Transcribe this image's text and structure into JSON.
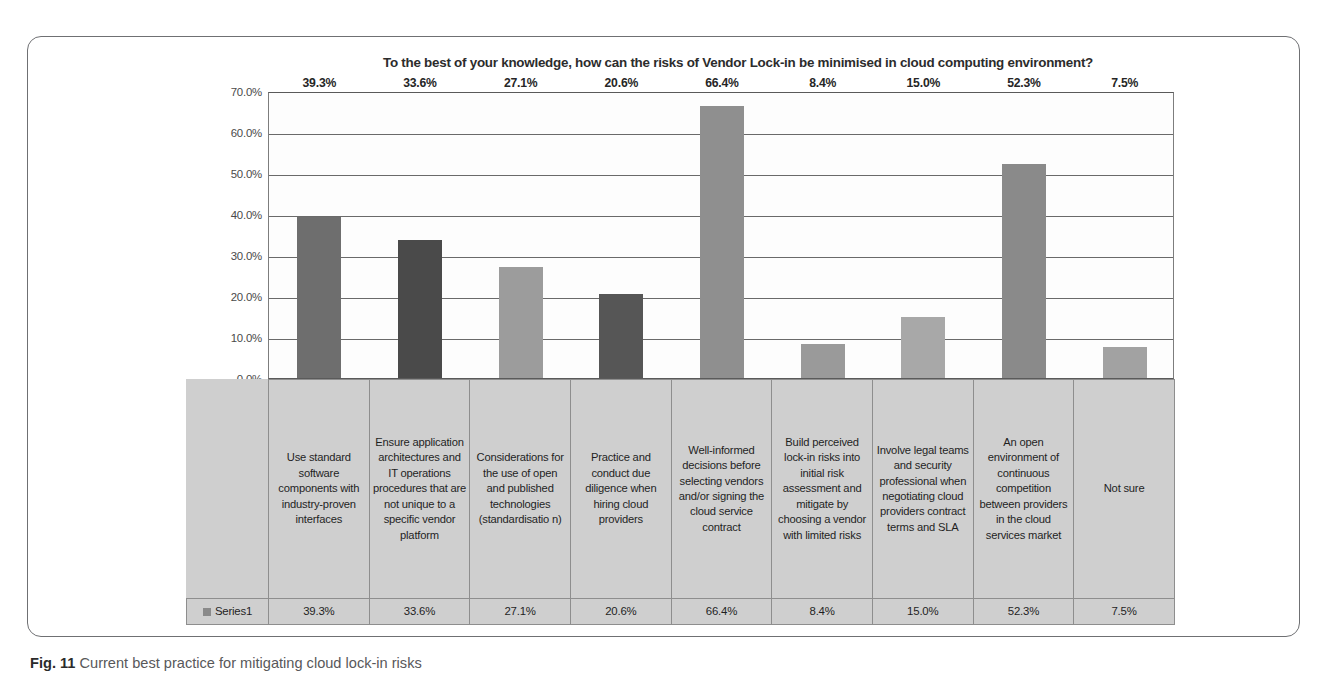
{
  "chart_data": {
    "type": "bar",
    "title": "To the best of your knowledge, how can the risks of Vendor Lock-in be minimised in cloud computing environment?",
    "xlabel": "",
    "ylabel": "",
    "ylim": [
      0,
      70
    ],
    "ytick_labels": [
      "70.0%",
      "60.0%",
      "50.0%",
      "40.0%",
      "30.0%",
      "20.0%",
      "10.0%",
      "0.0%"
    ],
    "ytick_values": [
      70,
      60,
      50,
      40,
      30,
      20,
      10,
      0
    ],
    "grid": true,
    "legend": "Series1",
    "legend_position": "bottom-left-table",
    "series": [
      {
        "name": "Series1",
        "values": [
          39.3,
          33.6,
          27.1,
          20.6,
          66.4,
          8.4,
          15.0,
          52.3,
          7.5
        ]
      }
    ],
    "categories": [
      "Use standard software components with industry-proven interfaces",
      "Ensure application architectures and IT operations procedures that are not unique to a specific vendor platform",
      "Considerations for the use of open and published technologies (standardisatio n)",
      "Practice and conduct due diligence when hiring cloud providers",
      "Well-informed decisions before selecting vendors and/or signing the cloud service contract",
      "Build perceived lock-in risks into initial risk assessment and mitigate by choosing a vendor with limited risks",
      "Involve legal teams and security professional when negotiating cloud providers contract terms and SLA",
      "An open environment of continuous competition between providers in the cloud services market",
      "Not sure"
    ],
    "data_labels": [
      "39.3%",
      "33.6%",
      "27.1%",
      "20.6%",
      "66.4%",
      "8.4%",
      "15.0%",
      "52.3%",
      "7.5%"
    ],
    "bar_colors": [
      "#6e6e6e",
      "#4a4a4a",
      "#9c9c9c",
      "#565656",
      "#8f8f8f",
      "#9a9a9a",
      "#a8a8a8",
      "#8a8a8a",
      "#a2a2a2"
    ]
  },
  "caption": {
    "figure_number": "Fig. 11",
    "text": "Current best practice for mitigating cloud lock-in risks"
  }
}
